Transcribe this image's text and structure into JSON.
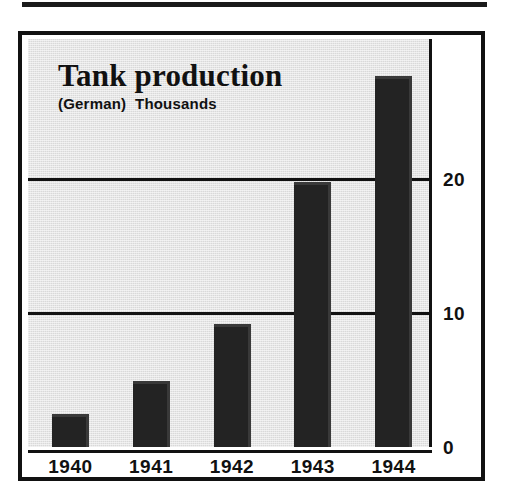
{
  "figure": {
    "background_color": "#d9d9d9",
    "frame_color": "#111111",
    "bar_color": "#232323",
    "top_rule": "horizontal-rule"
  },
  "chart_data": {
    "type": "bar",
    "title": "Tank production",
    "subtitle": "(German)  Thousands",
    "categories": [
      "1940",
      "1941",
      "1942",
      "1943",
      "1944"
    ],
    "values": [
      2.5,
      4.9,
      9.2,
      19.8,
      27.7
    ],
    "xlabel": "",
    "ylabel": "Thousands",
    "ylim": [
      0,
      30.5
    ],
    "yticks": [
      0,
      10,
      20
    ],
    "ytick_labels": [
      "0",
      "10",
      "20"
    ],
    "gridlines": [
      10,
      20
    ],
    "grid": true,
    "legend": null,
    "series": [
      {
        "name": "Tank production (German), thousands",
        "values": [
          2.5,
          4.9,
          9.2,
          19.8,
          27.7
        ]
      }
    ]
  }
}
